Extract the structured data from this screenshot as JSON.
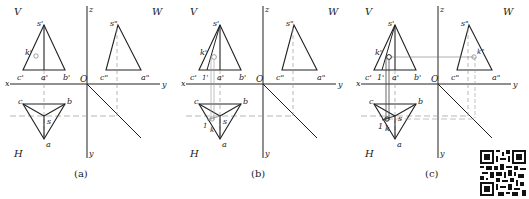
{
  "figure": {
    "panels": [
      {
        "id": "a",
        "caption": "(a)",
        "offset_x": 0,
        "plane_labels": {
          "V": "V",
          "W": "W",
          "H": "H"
        },
        "axis_labels": {
          "z": "z",
          "x": "x",
          "y_right": "y",
          "y_down": "y",
          "origin": "O"
        },
        "front_view": {
          "s": "s'",
          "c": "c'",
          "a": "a'",
          "b": "b'",
          "k": "k'"
        },
        "side_view": {
          "s": "s\"",
          "c": "c\"",
          "a": "a\""
        },
        "top_view": {
          "c": "c",
          "b": "b",
          "s": "s",
          "a": "a"
        },
        "construction": "point k' marked on front view face s'c'a'"
      },
      {
        "id": "b",
        "caption": "(b)",
        "offset_x": 175,
        "plane_labels": {
          "V": "V",
          "W": "W",
          "H": "H"
        },
        "axis_labels": {
          "z": "z",
          "x": "x",
          "y_right": "y",
          "y_down": "y",
          "origin": "O"
        },
        "front_view": {
          "s": "s'",
          "c": "c'",
          "a": "a'",
          "b": "b'",
          "k": "k'",
          "one": "1'"
        },
        "side_view": {
          "s": "s\"",
          "c": "c\"",
          "a": "a\""
        },
        "top_view": {
          "c": "c",
          "b": "b",
          "s": "s",
          "a": "a",
          "one": "1",
          "k": "k"
        },
        "construction": "auxiliary line s'1' drawn through k', projected to top view"
      },
      {
        "id": "c",
        "caption": "(c)",
        "offset_x": 350,
        "plane_labels": {
          "V": "V",
          "W": "W",
          "H": "H"
        },
        "axis_labels": {
          "z": "z",
          "x": "x",
          "y_right": "y",
          "y_down": "y",
          "origin": "O"
        },
        "front_view": {
          "s": "s'",
          "c": "c'",
          "a": "a'",
          "b": "b'",
          "k": "k'",
          "one": "1'"
        },
        "side_view": {
          "s": "s\"",
          "c": "c\"",
          "a": "a\"",
          "k": "k\""
        },
        "top_view": {
          "c": "c",
          "b": "b",
          "s": "s",
          "a": "a",
          "one": "1",
          "k": "k"
        },
        "construction": "k\" located in side view via 45° miter line"
      }
    ],
    "qr_code": "qr-code-icon",
    "colors": {
      "line": "#222222",
      "construction": "#888888",
      "dashed": "#999999"
    }
  }
}
